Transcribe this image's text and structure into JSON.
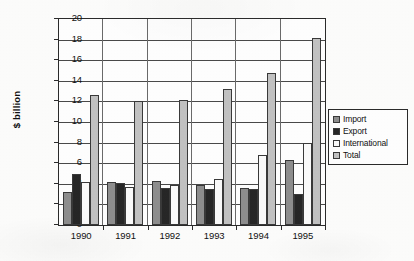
{
  "chart_data": {
    "type": "bar",
    "title": "",
    "xlabel": "",
    "ylabel": "$ billion",
    "ylim": [
      0,
      20
    ],
    "ytick_step": 2,
    "grid": true,
    "legend_position": "right",
    "categories": [
      "1990",
      "1991",
      "1992",
      "1993",
      "1994",
      "1995"
    ],
    "ytick_labels": [
      "20",
      "18",
      "16",
      "14",
      "12",
      "10",
      "8",
      "6",
      "4",
      "2",
      "0"
    ],
    "series": [
      {
        "name": "Import",
        "color": "#8e8e8e",
        "values": [
          3.2,
          4.2,
          4.3,
          3.9,
          3.6,
          6.3
        ]
      },
      {
        "name": "Export",
        "color": "#272727",
        "values": [
          5.0,
          4.1,
          3.6,
          3.5,
          3.5,
          3.0
        ]
      },
      {
        "name": "International",
        "color": "#fbfbfb",
        "values": [
          4.2,
          3.7,
          3.9,
          4.5,
          6.8,
          8.0
        ]
      },
      {
        "name": "Total",
        "color": "#c2c2c2",
        "values": [
          12.6,
          12.0,
          12.1,
          13.2,
          14.8,
          18.2
        ]
      }
    ]
  },
  "legend": {
    "items": [
      {
        "label": "Import"
      },
      {
        "label": "Export"
      },
      {
        "label": "International"
      },
      {
        "label": "Total"
      }
    ]
  }
}
